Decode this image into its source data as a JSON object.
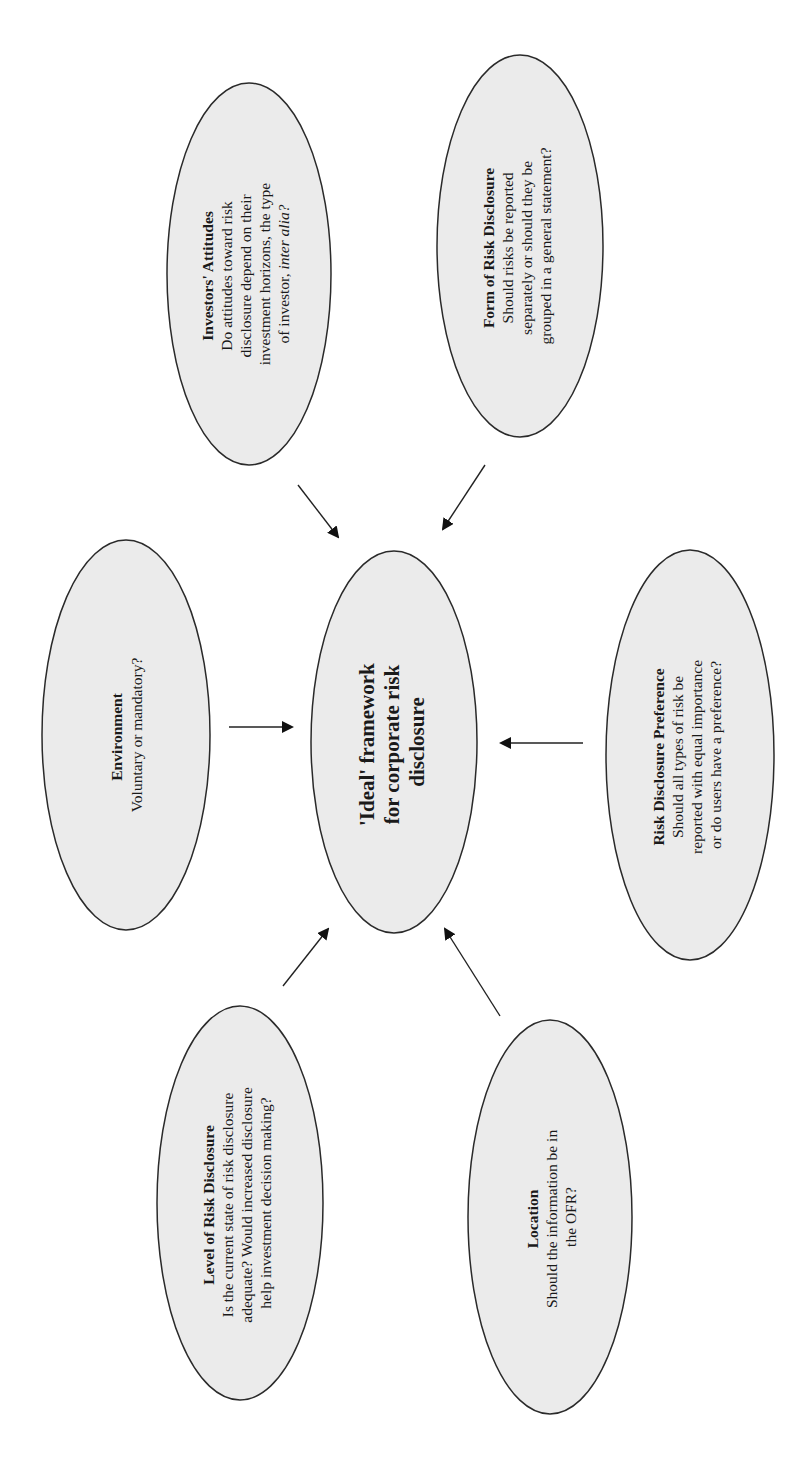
{
  "diagram": {
    "orientation": "rotated -90deg (landscape figure on portrait page)",
    "center": {
      "lines": [
        "'Ideal' framework",
        "for corporate risk",
        "disclosure"
      ]
    },
    "nodes": [
      {
        "id": "investors-attitudes",
        "title": "Investors' Attitudes",
        "lines": [
          "Do attitudes toward risk",
          "disclosure depend on their",
          "investment horizons, the type"
        ],
        "last_line_prefix": "of investor, ",
        "last_line_italic": "inter alia?"
      },
      {
        "id": "form-of-risk-disclosure",
        "title": "Form of Risk Disclosure",
        "lines": [
          "Should risks be reported",
          "separately or should they be",
          "grouped in a general statement?"
        ]
      },
      {
        "id": "environment",
        "title": "Environment",
        "lines": [
          "Voluntary or mandatory?"
        ]
      },
      {
        "id": "risk-disclosure-preference",
        "title": "Risk Disclosure Preference",
        "lines": [
          "Should all types of risk be",
          "reported with equal importance",
          "or do users have a preference?"
        ]
      },
      {
        "id": "level-of-risk-disclosure",
        "title": "Level of Risk Disclosure",
        "lines": [
          "Is the current state of risk disclosure",
          "adequate? Would increased disclosure",
          "help investment decision making?"
        ]
      },
      {
        "id": "location",
        "title": "Location",
        "lines": [
          "Should the information be in",
          "the OFR?"
        ]
      }
    ],
    "edges": [
      {
        "from": "investors-attitudes",
        "to": "center"
      },
      {
        "from": "form-of-risk-disclosure",
        "to": "center"
      },
      {
        "from": "environment",
        "to": "center"
      },
      {
        "from": "risk-disclosure-preference",
        "to": "center"
      },
      {
        "from": "level-of-risk-disclosure",
        "to": "center"
      },
      {
        "from": "location",
        "to": "center"
      }
    ],
    "colors": {
      "ellipse_fill": "#ebebeb",
      "ellipse_stroke": "#2a2a2a",
      "text": "#1a1a1a",
      "arrow": "#111111"
    }
  }
}
